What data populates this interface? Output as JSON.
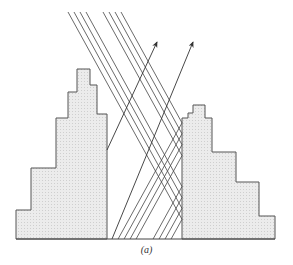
{
  "figure": {
    "caption": "(a)",
    "colors": {
      "line": "#444444",
      "building_fill": "#e6e6e6",
      "background": "#ffffff"
    },
    "left_building": {
      "points": [
        [
          16,
          239
        ],
        [
          16,
          210
        ],
        [
          31,
          210
        ],
        [
          31,
          168
        ],
        [
          56,
          168
        ],
        [
          56,
          118
        ],
        [
          68,
          118
        ],
        [
          68,
          92
        ],
        [
          77,
          92
        ],
        [
          77,
          69
        ],
        [
          90,
          69
        ],
        [
          90,
          85
        ],
        [
          97,
          85
        ],
        [
          97,
          114
        ],
        [
          107,
          114
        ],
        [
          107,
          239
        ]
      ]
    },
    "right_building": {
      "points": [
        [
          182,
          239
        ],
        [
          182,
          118
        ],
        [
          188,
          118
        ],
        [
          188,
          113
        ],
        [
          193,
          113
        ],
        [
          193,
          105
        ],
        [
          205,
          105
        ],
        [
          205,
          118
        ],
        [
          212,
          118
        ],
        [
          212,
          152
        ],
        [
          236,
          152
        ],
        [
          236,
          182
        ],
        [
          259,
          182
        ],
        [
          259,
          216
        ],
        [
          275,
          216
        ],
        [
          275,
          239
        ]
      ]
    },
    "ground": {
      "x1": 16,
      "x2": 275,
      "y": 239
    },
    "incident_rays": [
      {
        "x": 68
      },
      {
        "x": 74
      },
      {
        "x": 80
      },
      {
        "x": 86
      },
      {
        "x": 103
      },
      {
        "x": 109
      },
      {
        "x": 115
      },
      {
        "x": 121
      }
    ],
    "arrows": [
      {
        "from": [
          107,
          150
        ],
        "to": [
          157,
          42
        ]
      },
      {
        "from": [
          112,
          239
        ],
        "to": [
          193,
          42
        ]
      }
    ]
  }
}
